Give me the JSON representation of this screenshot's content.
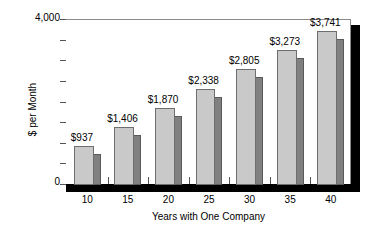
{
  "chart_data": {
    "type": "bar",
    "title": "",
    "xlabel": "Years with One Company",
    "ylabel": "$ per Month",
    "categories": [
      "10",
      "15",
      "20",
      "25",
      "30",
      "35",
      "40"
    ],
    "values": [
      937,
      1406,
      1870,
      2338,
      2805,
      3273,
      3741
    ],
    "data_labels": [
      "$937",
      "$1,406",
      "$1,870",
      "$2,338",
      "$2,805",
      "$3,273",
      "$3,741"
    ],
    "ylim": [
      0,
      4000
    ],
    "ytick_labels": [
      "0",
      "4,000"
    ],
    "ytick_values": [
      0,
      500,
      1000,
      1500,
      2000,
      2500,
      3000,
      3500,
      4000
    ],
    "grid": false,
    "legend": null,
    "style": "3d-shadow-bars",
    "colors": {
      "bar_face": "#c9c9c9",
      "bar_side": "#808080",
      "bar_edge": "#6e6e6e",
      "axis": "#555555",
      "frame": "#8a8a8a",
      "shadow": "#000000",
      "text": "#000000",
      "background": "#ffffff"
    }
  }
}
